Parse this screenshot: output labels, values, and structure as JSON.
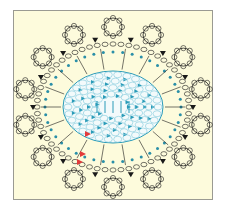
{
  "diagram": {
    "type": "crochet-chart",
    "colors": {
      "background": "#fdfbdc",
      "border": "#9a9a92",
      "center_rounds": "#2a9bb8",
      "center_fill": "#8fd0e0",
      "outer_rounds": "#1a1a1a",
      "dots": "#2a8fa8",
      "start_marker": "#e23b3b"
    },
    "center": {
      "cx": 113,
      "cy": 107
    },
    "inner_oval": {
      "rx": 50,
      "ry": 36
    },
    "outer_ring": {
      "rx": 76,
      "ry": 63
    },
    "scallop_count": 14,
    "spoke_count": 18,
    "start_markers": 3
  }
}
